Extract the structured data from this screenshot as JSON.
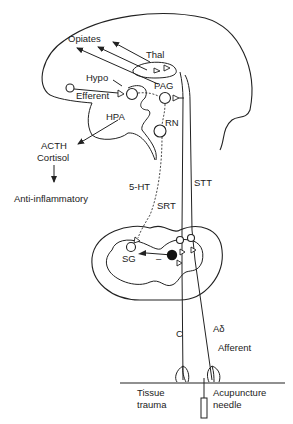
{
  "diagram": {
    "type": "pain-pathway-acupuncture",
    "labels": {
      "opiates": "Opiates",
      "thal": "Thal",
      "hypo": "Hypo",
      "pag": "PAG",
      "efferent": "Efferent",
      "hpa": "HPA",
      "rn": "RN",
      "acth": "ACTH",
      "cortisol": "Cortisol",
      "anti_inflammatory": "Anti-inflammatory",
      "five_ht": "5-HT",
      "srt": "SRT",
      "stt": "STT",
      "sg": "SG",
      "minus": "–",
      "c_fiber": "C",
      "a_delta": "Aδ",
      "afferent": "Afferent",
      "tissue": "Tissue",
      "trauma": "trauma",
      "acupuncture": "Acupuncture",
      "needle": "needle"
    },
    "colors": {
      "line": "#222222",
      "background": "#ffffff"
    }
  }
}
